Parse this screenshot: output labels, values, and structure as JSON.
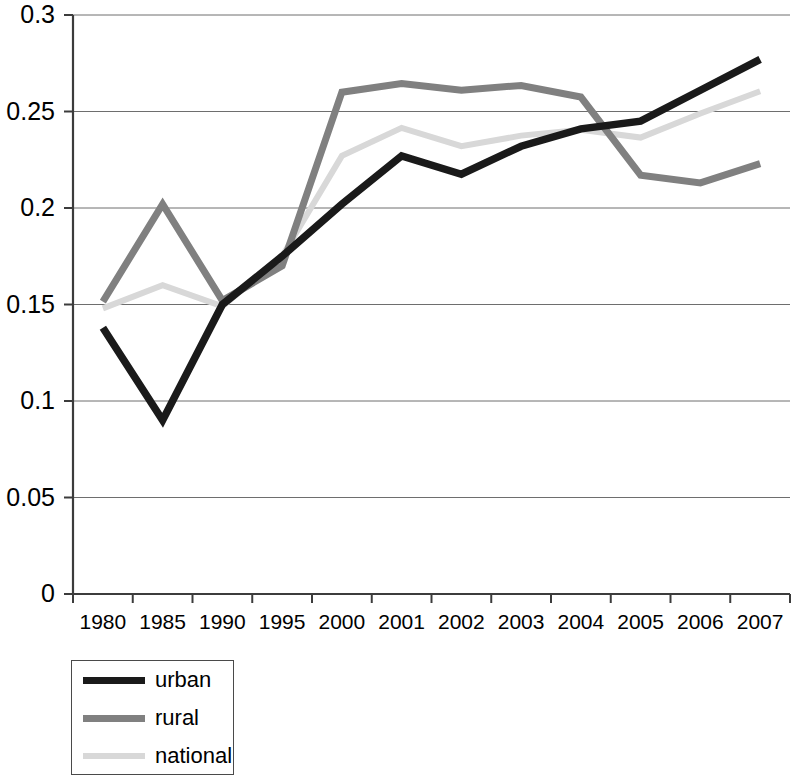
{
  "chart_data": {
    "type": "line",
    "title": "",
    "subtitle": "",
    "xlabel": "",
    "ylabel": "",
    "categories": [
      "1980",
      "1985",
      "1990",
      "1995",
      "2000",
      "2001",
      "2002",
      "2003",
      "2004",
      "2005",
      "2006",
      "2007"
    ],
    "series": [
      {
        "name": "urban",
        "color": "#1a1a1a",
        "values": [
          0.138,
          0.09,
          0.15,
          0.175,
          0.202,
          0.227,
          0.2175,
          0.232,
          0.241,
          0.245,
          0.261,
          0.277
        ]
      },
      {
        "name": "rural",
        "color": "#808080",
        "values": [
          0.1515,
          0.202,
          0.152,
          0.17,
          0.26,
          0.2645,
          0.261,
          0.2635,
          0.2575,
          0.217,
          0.213,
          0.223
        ]
      },
      {
        "name": "national",
        "color": "#d8d8d8",
        "values": [
          0.148,
          0.16,
          0.149,
          0.175,
          0.227,
          0.2415,
          0.232,
          0.2375,
          0.2405,
          0.2365,
          0.249,
          0.2605
        ]
      }
    ],
    "ylim": [
      0,
      0.3
    ],
    "yticks": [
      0,
      0.05,
      0.1,
      0.15,
      0.2,
      0.25,
      0.3
    ],
    "ytick_labels": [
      "0",
      "0.05",
      "0.1",
      "0.15",
      "0.2",
      "0.25",
      "0.3"
    ],
    "grid": true,
    "grid_axis": "y",
    "legend_position": "below-left",
    "legend_entries": [
      "urban",
      "rural",
      "national"
    ]
  },
  "legend": {
    "items": [
      {
        "label": "urban"
      },
      {
        "label": "rural"
      },
      {
        "label": "national"
      }
    ]
  },
  "colors": {
    "urban": "#1a1a1a",
    "rural": "#808080",
    "national": "#d8d8d8",
    "axis": "#3c3c3c",
    "grid": "#6e6e6e",
    "background": "#ffffff"
  }
}
